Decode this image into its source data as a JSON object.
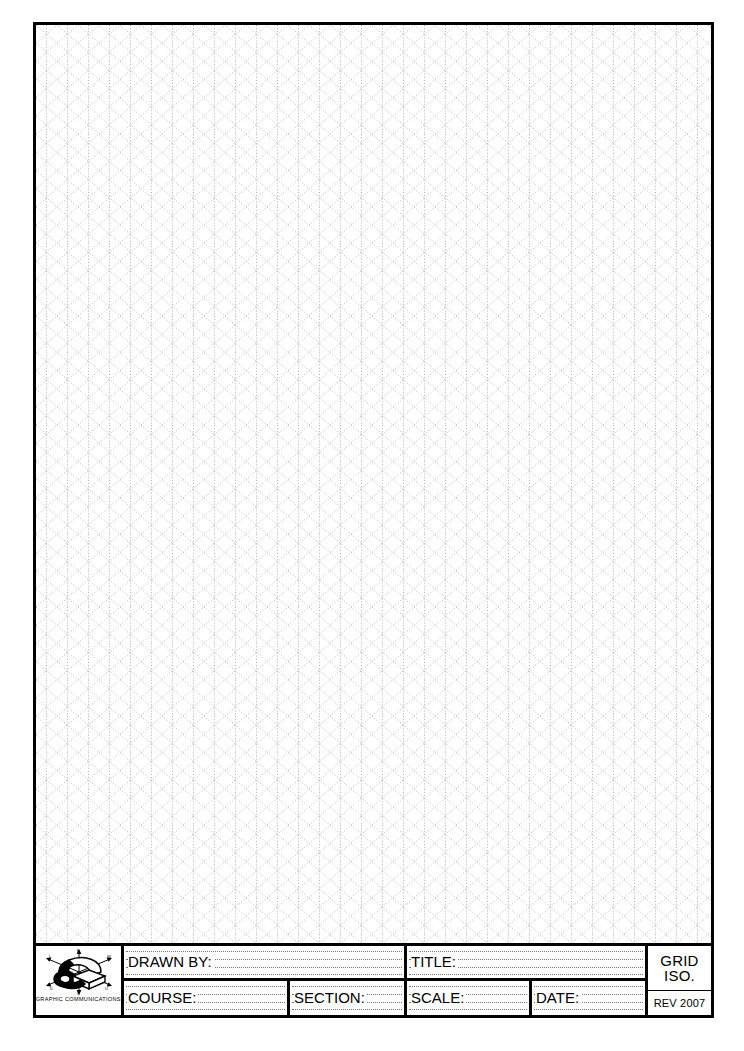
{
  "sheet": {
    "title": "Isometric Grid Drawing Sheet",
    "background_color": "#ffffff",
    "border_color": "#000000"
  },
  "grid": {
    "type": "isometric-dot-grid",
    "dot_color": "#9a9a9a",
    "vertical_spacing_px": 21,
    "angle_degrees": 30,
    "line_style": "dotted"
  },
  "title_block": {
    "logo": {
      "icon_name": "isometric-axes-logo",
      "caption": "GRAPHIC COMMUNICATIONS"
    },
    "fields": {
      "drawn_by": {
        "label": "DRAWN BY:",
        "value": ""
      },
      "title": {
        "label": "TITLE:",
        "value": ""
      },
      "course": {
        "label": "COURSE:",
        "value": ""
      },
      "section": {
        "label": "SECTION:",
        "value": ""
      },
      "scale": {
        "label": "SCALE:",
        "value": ""
      },
      "date": {
        "label": "DATE:",
        "value": ""
      }
    },
    "sheet_type": {
      "line1": "GRID",
      "line2": "ISO.",
      "revision": "REV 2007"
    }
  }
}
